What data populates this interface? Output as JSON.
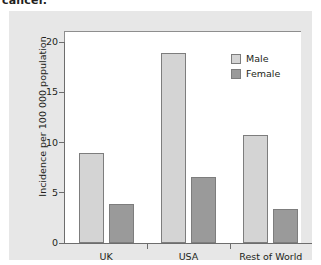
{
  "caption": {
    "text": "cancer."
  },
  "chart_data": {
    "type": "bar",
    "title": "",
    "xlabel": "",
    "ylabel": "Incidence per 100 000 population",
    "ylim": [
      0,
      20
    ],
    "yticks": [
      "0",
      "5",
      "10",
      "15",
      "20"
    ],
    "grid": false,
    "legend_position": "top-right",
    "categories": [
      "UK",
      "USA",
      "Rest of World"
    ],
    "series": [
      {
        "name": "Male",
        "color": "#d4d4d4",
        "values": [
          9.0,
          18.9,
          10.7
        ]
      },
      {
        "name": "Female",
        "color": "#9a9a9a",
        "values": [
          3.9,
          6.6,
          3.4
        ]
      }
    ]
  },
  "colors": {
    "panel_background": "#e7e7e7",
    "plot_background": "#ffffff",
    "axis": "#6d6d6d",
    "text": "#231f20",
    "bar_border": "#7d7d7d"
  }
}
